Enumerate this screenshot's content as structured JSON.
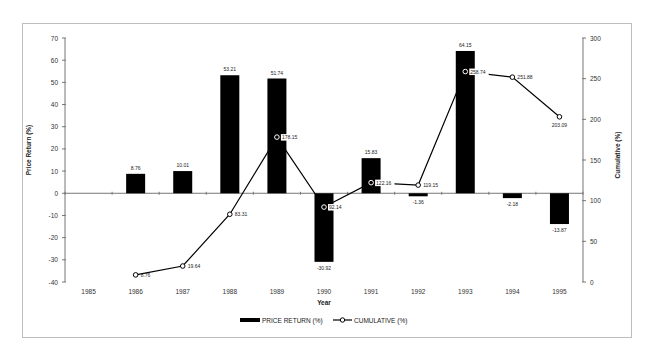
{
  "chart_data": {
    "type": "bar+line",
    "title": "",
    "xlabel": "Year",
    "ylabel_left": "Price Return (%)",
    "ylabel_right": "Cumulative (%)",
    "categories": [
      "1985",
      "1986",
      "1987",
      "1988",
      "1989",
      "1990",
      "1991",
      "1992",
      "1993",
      "1994",
      "1995"
    ],
    "ylim_left": [
      -40,
      70
    ],
    "yticks_left": [
      70,
      60,
      50,
      40,
      30,
      20,
      10,
      0,
      -10,
      -20,
      -30,
      -40
    ],
    "ylim_right": [
      0,
      300
    ],
    "yticks_right": [
      300,
      250,
      200,
      150,
      100,
      50,
      0
    ],
    "grid": false,
    "legend_position": "bottom",
    "series": [
      {
        "name": "PRICE RETURN (%)",
        "kind": "bar",
        "axis": "left",
        "values": [
          null,
          8.76,
          10.01,
          53.21,
          51.74,
          -30.92,
          15.83,
          -1.36,
          64.15,
          -2.18,
          -13.87
        ],
        "labels": [
          "",
          "8.76",
          "10.01",
          "53.21",
          "51.74",
          "-30.92",
          "15.83",
          "-1.36",
          "64.15",
          "-2.18",
          "-13.87"
        ]
      },
      {
        "name": "CUMULATIVE (%)",
        "kind": "line",
        "axis": "right",
        "values": [
          null,
          8.76,
          19.64,
          83.31,
          178.15,
          92.14,
          122.16,
          119.15,
          258.74,
          251.88,
          203.09
        ],
        "labels": [
          "",
          "8.76",
          "19.64",
          "83.31",
          "178.15",
          "92.14",
          "122.16",
          "119.15",
          "258.74",
          "251.88",
          "203.09"
        ]
      }
    ]
  },
  "legend": {
    "bar_label": "PRICE RETURN (%)",
    "line_label": "CUMULATIVE (%)"
  }
}
